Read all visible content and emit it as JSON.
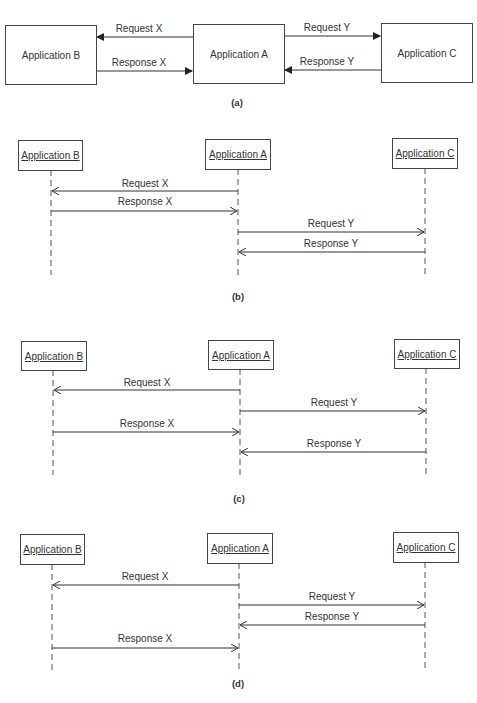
{
  "colors": {
    "line": "#444444",
    "text": "#333333",
    "background": "#ffffff"
  },
  "panels": [
    {
      "id": "a",
      "caption": "(a)",
      "type": "block",
      "boxes": [
        {
          "label": "Application B"
        },
        {
          "label": "Application A"
        },
        {
          "label": "Application C"
        }
      ],
      "messages": [
        {
          "label": "Request X",
          "from": "Application A",
          "to": "Application B"
        },
        {
          "label": "Response X",
          "from": "Application B",
          "to": "Application A"
        },
        {
          "label": "Request Y",
          "from": "Application A",
          "to": "Application C"
        },
        {
          "label": "Response Y",
          "from": "Application C",
          "to": "Application A"
        }
      ]
    },
    {
      "id": "b",
      "caption": "(b)",
      "type": "sequence",
      "participants": [
        {
          "label": "Application B"
        },
        {
          "label": "Application A"
        },
        {
          "label": "Application C"
        }
      ],
      "messages": [
        {
          "label": "Request X",
          "from": "Application A",
          "to": "Application B"
        },
        {
          "label": "Response X",
          "from": "Application B",
          "to": "Application A"
        },
        {
          "label": "Request Y",
          "from": "Application A",
          "to": "Application C"
        },
        {
          "label": "Response Y",
          "from": "Application C",
          "to": "Application A"
        }
      ]
    },
    {
      "id": "c",
      "caption": "(c)",
      "type": "sequence",
      "participants": [
        {
          "label": "Application B"
        },
        {
          "label": "Application A"
        },
        {
          "label": "Application C"
        }
      ],
      "messages": [
        {
          "label": "Request X",
          "from": "Application A",
          "to": "Application B"
        },
        {
          "label": "Request Y",
          "from": "Application A",
          "to": "Application C"
        },
        {
          "label": "Response X",
          "from": "Application B",
          "to": "Application A"
        },
        {
          "label": "Response Y",
          "from": "Application C",
          "to": "Application A"
        }
      ]
    },
    {
      "id": "d",
      "caption": "(d)",
      "type": "sequence",
      "participants": [
        {
          "label": "Application B"
        },
        {
          "label": "Application A"
        },
        {
          "label": "Application C"
        }
      ],
      "messages": [
        {
          "label": "Request X",
          "from": "Application A",
          "to": "Application B"
        },
        {
          "label": "Request Y",
          "from": "Application A",
          "to": "Application C"
        },
        {
          "label": "Response Y",
          "from": "Application C",
          "to": "Application A"
        },
        {
          "label": "Response X",
          "from": "Application B",
          "to": "Application A"
        }
      ]
    }
  ]
}
